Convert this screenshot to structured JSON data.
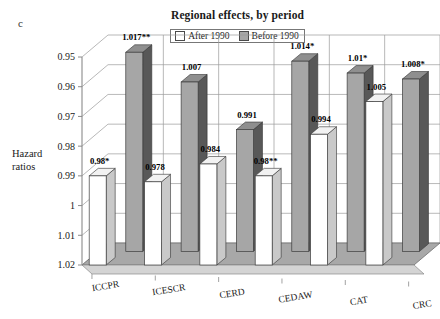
{
  "panel_letter": "c",
  "title": "Regional effects, by period",
  "legend": {
    "position": "top-center",
    "entries": [
      {
        "label": "After 1990",
        "color": "#ffffff",
        "name": "legend-after-1990"
      },
      {
        "label": "Before 1990",
        "color": "#a6a6a6",
        "name": "legend-before-1990"
      }
    ]
  },
  "axis": {
    "y_title_line1": "Hazard",
    "y_title_line2": "ratios",
    "y_ticks": [
      "1.02",
      "1.01",
      "1",
      "0.99",
      "0.98",
      "0.97",
      "0.96",
      "0.95"
    ]
  },
  "chart_data": {
    "type": "bar",
    "title": "Regional effects, by period",
    "xlabel": "",
    "ylabel": "Hazard ratios",
    "ylim": [
      0.95,
      1.02
    ],
    "yticks": [
      0.95,
      0.96,
      0.97,
      0.98,
      0.99,
      1.0,
      1.01,
      1.02
    ],
    "grid": true,
    "legend_position": "top-center",
    "categories": [
      "ICCPR",
      "ICESCR",
      "CERD",
      "CEDAW",
      "CAT",
      "CRC"
    ],
    "series": [
      {
        "name": "After 1990",
        "color": "#ffffff",
        "values": [
          0.98,
          0.978,
          0.984,
          0.98,
          0.994,
          1.005
        ],
        "labels": [
          "0.98*",
          "0.978",
          "0.984",
          "0.98**",
          "0.994",
          "1.005"
        ]
      },
      {
        "name": "Before 1990",
        "color": "#a6a6a6",
        "values": [
          1.017,
          1.007,
          0.991,
          1.014,
          1.01,
          1.008
        ],
        "labels": [
          "1.017**",
          "1.007",
          "0.991",
          "1.014*",
          "1.01*",
          "1.008*"
        ]
      }
    ]
  }
}
